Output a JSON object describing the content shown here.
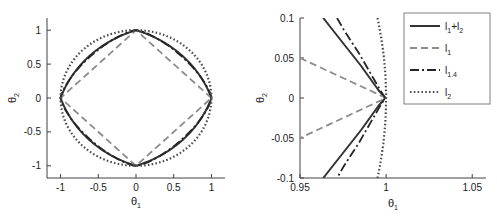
{
  "figure": {
    "background": "#ffffff",
    "panel_count": 2
  },
  "colors": {
    "l1_l2": "#333333",
    "l1": "#8c8c8c",
    "l14": "#262626",
    "l2": "#4d4d4d",
    "axis": "#404040",
    "text": "#1a1a1a",
    "legend_border": "#808080"
  },
  "chart_data": [
    {
      "type": "line",
      "id": "left-panel",
      "title": "",
      "xlabel": "θ₁",
      "ylabel": "θ₂",
      "xlim": [
        -1.18,
        1.18
      ],
      "ylim": [
        -1.18,
        1.18
      ],
      "xticks": [
        -1,
        -0.5,
        0,
        0.5,
        1
      ],
      "xticklabels": [
        "-1",
        "-0.5",
        "0",
        "0.5",
        "1"
      ],
      "yticks": [
        -1,
        -0.5,
        0,
        0.5,
        1
      ],
      "yticklabels": [
        "-1",
        "-0.5",
        "0",
        "0.5",
        "1"
      ],
      "grid": false,
      "legend": "none",
      "series": [
        {
          "name": "l₁+l₂",
          "style": "solid",
          "description": "Elastic-net unit ball: rounded diamond passing through (±1,0) and (0,±1)",
          "norm_p": 1.0,
          "alpha": 0.5,
          "points_xy": [
            [
              1,
              0
            ],
            [
              0.97,
              0.12
            ],
            [
              0.92,
              0.235
            ],
            [
              0.855,
              0.345
            ],
            [
              0.78,
              0.45
            ],
            [
              0.695,
              0.55
            ],
            [
              0.6,
              0.645
            ],
            [
              0.5,
              0.735
            ],
            [
              0.39,
              0.82
            ],
            [
              0.27,
              0.895
            ],
            [
              0.14,
              0.955
            ],
            [
              0,
              1
            ],
            [
              -0.14,
              0.955
            ],
            [
              -0.27,
              0.895
            ],
            [
              -0.39,
              0.82
            ],
            [
              -0.5,
              0.735
            ],
            [
              -0.6,
              0.645
            ],
            [
              -0.695,
              0.55
            ],
            [
              -0.78,
              0.45
            ],
            [
              -0.855,
              0.345
            ],
            [
              -0.92,
              0.235
            ],
            [
              -0.97,
              0.12
            ],
            [
              -1,
              0
            ],
            [
              -0.97,
              -0.12
            ],
            [
              -0.92,
              -0.235
            ],
            [
              -0.855,
              -0.345
            ],
            [
              -0.78,
              -0.45
            ],
            [
              -0.695,
              -0.55
            ],
            [
              -0.6,
              -0.645
            ],
            [
              -0.5,
              -0.735
            ],
            [
              -0.39,
              -0.82
            ],
            [
              -0.27,
              -0.895
            ],
            [
              -0.14,
              -0.955
            ],
            [
              0,
              -1
            ],
            [
              0.14,
              -0.955
            ],
            [
              0.27,
              -0.895
            ],
            [
              0.39,
              -0.82
            ],
            [
              0.5,
              -0.735
            ],
            [
              0.6,
              -0.645
            ],
            [
              0.695,
              -0.55
            ],
            [
              0.78,
              -0.45
            ],
            [
              0.855,
              -0.345
            ],
            [
              0.92,
              -0.235
            ],
            [
              0.97,
              -0.12
            ],
            [
              1,
              0
            ]
          ]
        },
        {
          "name": "l₁",
          "style": "dashed",
          "description": "l1 unit ball: diamond with vertices (±1,0),(0,±1)",
          "norm_p": 1,
          "points_xy": [
            [
              1,
              0
            ],
            [
              0,
              1
            ],
            [
              -1,
              0
            ],
            [
              0,
              -1
            ],
            [
              1,
              0
            ]
          ]
        },
        {
          "name": "l₁.₄",
          "style": "dashdot",
          "description": "l1.4 unit ball: superellipse |x|^1.4+|y|^1.4=1",
          "norm_p": 1.4,
          "points_xy": [
            [
              1,
              0
            ],
            [
              0.985,
              0.1
            ],
            [
              0.955,
              0.21
            ],
            [
              0.91,
              0.32
            ],
            [
              0.85,
              0.43
            ],
            [
              0.775,
              0.535
            ],
            [
              0.69,
              0.635
            ],
            [
              0.59,
              0.73
            ],
            [
              0.475,
              0.82
            ],
            [
              0.345,
              0.9
            ],
            [
              0.19,
              0.965
            ],
            [
              0,
              1
            ],
            [
              -0.19,
              0.965
            ],
            [
              -0.345,
              0.9
            ],
            [
              -0.475,
              0.82
            ],
            [
              -0.59,
              0.73
            ],
            [
              -0.69,
              0.635
            ],
            [
              -0.775,
              0.535
            ],
            [
              -0.85,
              0.43
            ],
            [
              -0.91,
              0.32
            ],
            [
              -0.955,
              0.21
            ],
            [
              -0.985,
              0.1
            ],
            [
              -1,
              0
            ],
            [
              -0.985,
              -0.1
            ],
            [
              -0.955,
              -0.21
            ],
            [
              -0.91,
              -0.32
            ],
            [
              -0.85,
              -0.43
            ],
            [
              -0.775,
              -0.535
            ],
            [
              -0.69,
              -0.635
            ],
            [
              -0.59,
              -0.73
            ],
            [
              -0.475,
              -0.82
            ],
            [
              -0.345,
              -0.9
            ],
            [
              -0.19,
              -0.965
            ],
            [
              0,
              -1
            ],
            [
              0.19,
              -0.965
            ],
            [
              0.345,
              -0.9
            ],
            [
              0.475,
              -0.82
            ],
            [
              0.59,
              -0.73
            ],
            [
              0.69,
              -0.635
            ],
            [
              0.775,
              -0.535
            ],
            [
              0.85,
              -0.43
            ],
            [
              0.91,
              -0.32
            ],
            [
              0.955,
              -0.21
            ],
            [
              0.985,
              -0.1
            ],
            [
              1,
              0
            ]
          ]
        },
        {
          "name": "l₂",
          "style": "dotted",
          "description": "l2 unit ball: circle of radius 1",
          "norm_p": 2,
          "radius": 1
        }
      ]
    },
    {
      "type": "line",
      "id": "right-panel",
      "title": "",
      "xlabel": "θ₁",
      "ylabel": "θ₂",
      "xlim": [
        0.95,
        1.058
      ],
      "ylim": [
        -0.1,
        0.1
      ],
      "xticks": [
        0.95,
        1,
        1.05
      ],
      "xticklabels": [
        "0.95",
        "1",
        "1.05"
      ],
      "yticks": [
        -0.1,
        -0.05,
        0,
        0.05,
        0.1
      ],
      "yticklabels": [
        "-0.1",
        "-0.05",
        "0",
        "0.05",
        "0.1"
      ],
      "grid": false,
      "legend": "upper right",
      "note": "Zoom near the corner (θ₁,θ₂)=(1,0); all balls meet at (1,0)",
      "series": [
        {
          "name": "l₁+l₂",
          "style": "solid",
          "points_xy": [
            [
              0.9635,
              0.1
            ],
            [
              0.969,
              0.085
            ],
            [
              0.9745,
              0.07
            ],
            [
              0.98,
              0.055
            ],
            [
              0.9855,
              0.04
            ],
            [
              0.9905,
              0.025
            ],
            [
              0.9955,
              0.01
            ],
            [
              0.9995,
              0.0
            ],
            [
              0.9955,
              -0.01
            ],
            [
              0.9905,
              -0.025
            ],
            [
              0.9855,
              -0.04
            ],
            [
              0.98,
              -0.055
            ],
            [
              0.9745,
              -0.07
            ],
            [
              0.969,
              -0.085
            ],
            [
              0.9635,
              -0.1
            ]
          ]
        },
        {
          "name": "l₁",
          "style": "dashed",
          "points_xy": [
            [
              0.95,
              0.05
            ],
            [
              0.96,
              0.04
            ],
            [
              0.97,
              0.03
            ],
            [
              0.98,
              0.02
            ],
            [
              0.99,
              0.01
            ],
            [
              1.0,
              0.0
            ],
            [
              0.99,
              -0.01
            ],
            [
              0.98,
              -0.02
            ],
            [
              0.97,
              -0.03
            ],
            [
              0.96,
              -0.04
            ],
            [
              0.95,
              -0.05
            ]
          ]
        },
        {
          "name": "l₁.₄",
          "style": "dashdot",
          "points_xy": [
            [
              0.9715,
              0.1
            ],
            [
              0.9755,
              0.085
            ],
            [
              0.98,
              0.07
            ],
            [
              0.9845,
              0.055
            ],
            [
              0.9885,
              0.04
            ],
            [
              0.9925,
              0.025
            ],
            [
              0.996,
              0.012
            ],
            [
              0.9995,
              0.0
            ],
            [
              0.996,
              -0.012
            ],
            [
              0.9925,
              -0.025
            ],
            [
              0.9885,
              -0.04
            ],
            [
              0.9845,
              -0.055
            ],
            [
              0.98,
              -0.07
            ],
            [
              0.9755,
              -0.085
            ],
            [
              0.9715,
              -0.1
            ]
          ]
        },
        {
          "name": "l₂",
          "style": "dotted",
          "points_xy": [
            [
              0.995,
              0.1
            ],
            [
              0.99625,
              0.0866
            ],
            [
              0.99735,
              0.0728
            ],
            [
              0.99835,
              0.0574
            ],
            [
              0.99905,
              0.0436
            ],
            [
              0.99955,
              0.03
            ],
            [
              0.99985,
              0.0173
            ],
            [
              1.0,
              0.0
            ],
            [
              0.99985,
              -0.0173
            ],
            [
              0.99955,
              -0.03
            ],
            [
              0.99905,
              -0.0436
            ],
            [
              0.99835,
              -0.0574
            ],
            [
              0.99735,
              -0.0728
            ],
            [
              0.99625,
              -0.0866
            ],
            [
              0.995,
              -0.1
            ]
          ]
        }
      ]
    }
  ],
  "left_panel": {
    "name": "left-panel",
    "xlabel": "θ",
    "xlabel_sub": "1",
    "ylabel": "θ",
    "ylabel_sub": "2",
    "xticklabels": [
      "-1",
      "-0.5",
      "0",
      "0.5",
      "1"
    ],
    "yticklabels": [
      "1",
      "0.5",
      "0",
      "-0.5",
      "-1"
    ]
  },
  "right_panel": {
    "name": "right-panel",
    "xlabel": "θ",
    "xlabel_sub": "1",
    "ylabel": "θ",
    "ylabel_sub": "2",
    "xticklabels": [
      "0.95",
      "1",
      "1.05"
    ],
    "yticklabels": [
      "0.1",
      "0.05",
      "0",
      "-0.05",
      "-0.1"
    ]
  },
  "legend": {
    "name": "legend-box",
    "position": "upper-right",
    "entries": [
      {
        "base": "l",
        "sub": "1",
        "suffix": "+l",
        "suffix_sub": "2",
        "style": "solid",
        "full": "l1+l2"
      },
      {
        "base": "l",
        "sub": "1",
        "suffix": "",
        "suffix_sub": "",
        "style": "dashed",
        "full": "l1"
      },
      {
        "base": "l",
        "sub": "1.4",
        "suffix": "",
        "suffix_sub": "",
        "style": "dashdot",
        "full": "l1.4"
      },
      {
        "base": "l",
        "sub": "2",
        "suffix": "",
        "suffix_sub": "",
        "style": "dotted",
        "full": "l2"
      }
    ]
  }
}
